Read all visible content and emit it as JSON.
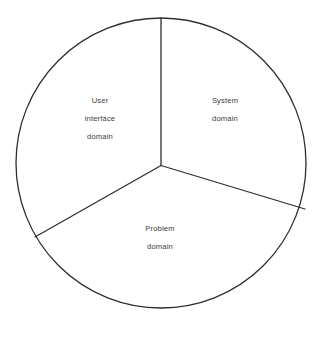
{
  "diagram": {
    "type": "pie-partition-diagram",
    "title": "",
    "background_color": "#ffffff",
    "stroke_color": "#2e2e2e",
    "text_color": "#3c3c3c",
    "circle": {
      "center_x": 161,
      "center_y": 163,
      "radius": 145
    },
    "sectors": [
      {
        "name": "user-interface-domain",
        "lines": [
          "User",
          "interface",
          "domain"
        ],
        "label_center_x": 100,
        "label_center_y": 122
      },
      {
        "name": "system-domain",
        "lines": [
          "System",
          "domain"
        ],
        "label_center_x": 225,
        "label_center_y": 113
      },
      {
        "name": "problem-domain",
        "lines": [
          "Problem",
          "domain"
        ],
        "label_center_x": 160,
        "label_center_y": 241
      }
    ],
    "dividers": [
      {
        "name": "divider-top",
        "end_x": 161,
        "end_y": 18
      },
      {
        "name": "divider-lower-left",
        "end_x": 35,
        "end_y": 237
      },
      {
        "name": "divider-lower-right",
        "end_x": 305,
        "end_y": 209
      }
    ]
  },
  "labels": {
    "user_interface": {
      "line1": "User",
      "line2": "interface",
      "line3": "domain"
    },
    "system": {
      "line1": "System",
      "line2": "domain"
    },
    "problem": {
      "line1": "Problem",
      "line2": "domain"
    }
  }
}
